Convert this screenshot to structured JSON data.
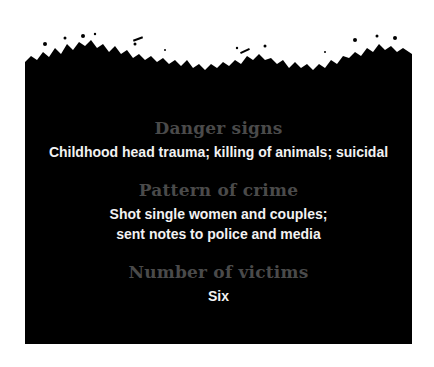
{
  "panel": {
    "background": "#000000",
    "heading_color": "#4a4a4a",
    "value_color": "#f2f2f2"
  },
  "sections": [
    {
      "heading": "Danger signs",
      "lines": [
        "Childhood head trauma; killing of animals; suicidal"
      ]
    },
    {
      "heading": "Pattern of crime",
      "lines": [
        "Shot single women and couples;",
        "sent notes to police and media"
      ]
    },
    {
      "heading": "Number of victims",
      "lines": [
        "Six"
      ]
    }
  ]
}
